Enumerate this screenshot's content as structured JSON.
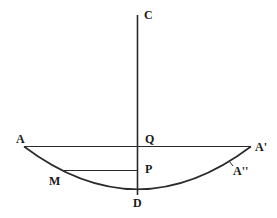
{
  "diagram": {
    "labels": {
      "C": "C",
      "A": "A",
      "Q": "Q",
      "A_prime": "A'",
      "P": "P",
      "A_double_prime": "A''",
      "M": "M",
      "D": "D"
    },
    "colors": {
      "stroke": "#2a2a2a",
      "text": "#1a1a1a",
      "background": "#ffffff"
    }
  }
}
